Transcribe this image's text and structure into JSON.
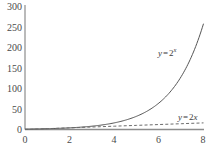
{
  "chart_data": {
    "type": "line",
    "title": "",
    "subtitle": "",
    "xlabel": "",
    "ylabel": "",
    "xlim": [
      0,
      8
    ],
    "ylim": [
      0,
      300
    ],
    "grid": false,
    "legend_position": "inline-annotation",
    "xticks": [
      "0",
      "2",
      "4",
      "6",
      "8"
    ],
    "xtick_values": [
      0,
      2,
      4,
      6,
      8
    ],
    "yticks": [
      "0",
      "50",
      "100",
      "150",
      "200",
      "250",
      "300"
    ],
    "ytick_values": [
      0,
      50,
      100,
      150,
      200,
      250,
      300
    ],
    "series": [
      {
        "name": "y = 2^x",
        "label_prefix": "y",
        "label_op": "=",
        "label_base": "2",
        "label_exponent": "x",
        "style": "solid",
        "color": "#555555",
        "x": [
          0,
          0.5,
          1,
          1.5,
          2,
          2.5,
          3,
          3.5,
          4,
          4.5,
          5,
          5.5,
          6,
          6.5,
          7,
          7.5,
          8
        ],
        "values": [
          1,
          1.41,
          2,
          2.83,
          4,
          5.66,
          8,
          11.31,
          16,
          22.63,
          32,
          45.25,
          64,
          90.51,
          128,
          181.02,
          256
        ]
      },
      {
        "name": "y = 2x",
        "label_prefix": "y",
        "label_op": "=",
        "label_base": "2",
        "label_exponent": "",
        "label_var": "x",
        "style": "dashed",
        "color": "#6b6b6b",
        "x": [
          0,
          1,
          2,
          3,
          4,
          5,
          6,
          7,
          8
        ],
        "values": [
          0,
          2,
          4,
          6,
          8,
          10,
          12,
          14,
          16
        ]
      }
    ],
    "annotations": [
      {
        "text": "y = 2^x",
        "x": 6.2,
        "y": 170
      },
      {
        "text": "y = 2x",
        "x": 6.6,
        "y": 42
      }
    ]
  },
  "axes": {
    "axis_color": "#8c8c8c",
    "background": "#ffffff",
    "tick_label_color": "#4a4a4a"
  }
}
